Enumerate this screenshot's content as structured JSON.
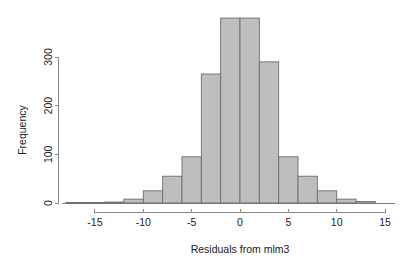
{
  "chart_data": {
    "type": "bar",
    "title": "",
    "subtitle": "",
    "xlabel": "Residuals from mlm3",
    "ylabel": "Frequency",
    "xlim": [
      -17.5,
      15.5
    ],
    "ylim": [
      0,
      390
    ],
    "grid": false,
    "legend": null,
    "bin_width": 2,
    "x_ticks": [
      -15,
      -10,
      -5,
      0,
      5,
      10,
      15
    ],
    "x_tick_labels": [
      "-15",
      "-10",
      "-5",
      "0",
      "5",
      "10",
      "15"
    ],
    "y_ticks": [
      0,
      100,
      200,
      300
    ],
    "y_tick_labels": [
      "0",
      "100",
      "200",
      "300"
    ],
    "bar_fill_color": "#bebebe",
    "bar_edge_color": "#6e6e6e",
    "axis_color": "#888888",
    "bins": [
      {
        "x0": -18,
        "x1": -16,
        "value": 1
      },
      {
        "x0": -16,
        "x1": -14,
        "value": 1
      },
      {
        "x0": -14,
        "x1": -12,
        "value": 2
      },
      {
        "x0": -12,
        "x1": -10,
        "value": 8
      },
      {
        "x0": -10,
        "x1": -8,
        "value": 25
      },
      {
        "x0": -8,
        "x1": -6,
        "value": 55
      },
      {
        "x0": -6,
        "x1": -4,
        "value": 95
      },
      {
        "x0": -4,
        "x1": -2,
        "value": 265
      },
      {
        "x0": -2,
        "x1": 0,
        "value": 380
      },
      {
        "x0": 0,
        "x1": 2,
        "value": 380
      },
      {
        "x0": 2,
        "x1": 4,
        "value": 290
      },
      {
        "x0": 4,
        "x1": 6,
        "value": 95
      },
      {
        "x0": 6,
        "x1": 8,
        "value": 55
      },
      {
        "x0": 8,
        "x1": 10,
        "value": 25
      },
      {
        "x0": 10,
        "x1": 12,
        "value": 8
      },
      {
        "x0": 12,
        "x1": 14,
        "value": 3
      }
    ],
    "categories": [
      "-18",
      "-16",
      "-14",
      "-12",
      "-10",
      "-8",
      "-6",
      "-4",
      "-2",
      "0",
      "2",
      "4",
      "6",
      "8",
      "10",
      "12"
    ],
    "values": [
      1,
      1,
      2,
      8,
      25,
      55,
      95,
      265,
      380,
      380,
      290,
      95,
      55,
      25,
      8,
      3
    ]
  }
}
